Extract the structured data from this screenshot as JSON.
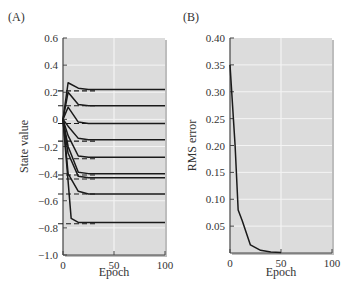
{
  "figure": {
    "panels": [
      {
        "label": "(A)",
        "ylabel": "State value",
        "xlabel": "Epoch"
      },
      {
        "label": "(B)",
        "ylabel": "RMS error",
        "xlabel": "Epoch"
      }
    ]
  },
  "colors": {
    "plot_bg": "#dcdcdc",
    "grid": "#f4f4f4",
    "line": "#1a1a1a",
    "axis": "#444444"
  },
  "chart_data": [
    {
      "type": "line",
      "title": "(A)",
      "xlabel": "Epoch",
      "ylabel": "State value",
      "xlim": [
        0,
        100
      ],
      "ylim": [
        -1.0,
        0.6
      ],
      "xticks": [
        0,
        50,
        100
      ],
      "yticks": [
        0.6,
        0.4,
        0.2,
        0,
        -0.2,
        -0.4,
        -0.6,
        -0.8,
        -1.0
      ],
      "ytick_labels": [
        "0.6",
        "0.4",
        "0.2",
        "0",
        "−0.2",
        "−0.4",
        "−0.6",
        "−0.8",
        "−1.0"
      ],
      "grid": true,
      "legend": null,
      "annotations": "Dashed horizontal lines mark true (target) state values; solid curves show learned estimates converging to them.",
      "series": [
        {
          "name": "state 1",
          "x": [
            0,
            5,
            15,
            25,
            100
          ],
          "values": [
            0,
            0.27,
            0.23,
            0.22,
            0.22
          ],
          "target": 0.21
        },
        {
          "name": "state 2",
          "x": [
            0,
            5,
            15,
            25,
            100
          ],
          "values": [
            0,
            0.2,
            0.11,
            0.1,
            0.1
          ],
          "target": 0.1
        },
        {
          "name": "state 3",
          "x": [
            0,
            5,
            15,
            25,
            100
          ],
          "values": [
            0,
            0.09,
            -0.02,
            -0.03,
            -0.03
          ],
          "target": -0.03
        },
        {
          "name": "state 4",
          "x": [
            0,
            5,
            15,
            25,
            100
          ],
          "values": [
            0,
            -0.05,
            -0.14,
            -0.15,
            -0.15
          ],
          "target": -0.16
        },
        {
          "name": "state 5",
          "x": [
            0,
            5,
            15,
            25,
            100
          ],
          "values": [
            0,
            -0.12,
            -0.27,
            -0.28,
            -0.28
          ],
          "target": -0.29
        },
        {
          "name": "state 6",
          "x": [
            0,
            5,
            15,
            25,
            100
          ],
          "values": [
            0,
            -0.2,
            -0.39,
            -0.4,
            -0.4
          ],
          "target": -0.41
        },
        {
          "name": "state 7",
          "x": [
            0,
            5,
            15,
            25,
            100
          ],
          "values": [
            0,
            -0.25,
            -0.42,
            -0.43,
            -0.43
          ],
          "target": -0.44
        },
        {
          "name": "state 8",
          "x": [
            0,
            5,
            15,
            25,
            100
          ],
          "values": [
            0,
            -0.4,
            -0.53,
            -0.55,
            -0.55
          ],
          "target": -0.55
        },
        {
          "name": "state 9",
          "x": [
            0,
            8,
            15,
            25,
            100
          ],
          "values": [
            0,
            -0.73,
            -0.76,
            -0.76,
            -0.76
          ],
          "target": -0.77
        }
      ]
    },
    {
      "type": "line",
      "title": "(B)",
      "xlabel": "Epoch",
      "ylabel": "RMS error",
      "xlim": [
        0,
        100
      ],
      "ylim": [
        0,
        0.4
      ],
      "xticks": [
        0,
        50,
        100
      ],
      "yticks": [
        0.4,
        0.35,
        0.3,
        0.25,
        0.2,
        0.15,
        0.1,
        0.05
      ],
      "ytick_labels": [
        "0.40",
        "0.35",
        "0.30",
        "0.25",
        "0.20",
        "0.15",
        "0.10",
        "0.05"
      ],
      "grid": true,
      "legend": null,
      "series": [
        {
          "name": "RMS error",
          "x": [
            0,
            5,
            8,
            12,
            20,
            30,
            40,
            50
          ],
          "values": [
            0.35,
            0.2,
            0.08,
            0.06,
            0.015,
            0.005,
            0.002,
            0.001
          ]
        }
      ]
    }
  ]
}
